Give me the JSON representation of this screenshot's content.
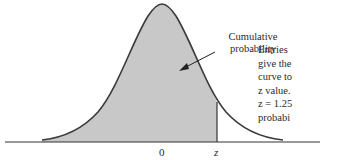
{
  "figure": {
    "type": "standard-normal-curve",
    "fill_color": "#c8c8c8",
    "curve_color": "#3a3a3a",
    "axis_color": "#333333",
    "callout": {
      "line1": "Cumulative",
      "line2": "probability"
    },
    "axis_labels": {
      "mean": "0",
      "z": "z"
    },
    "side_text": {
      "lines": [
        "Entries",
        "give the",
        "curve to",
        "z value.",
        "z = 1.25",
        "probabi"
      ]
    }
  }
}
